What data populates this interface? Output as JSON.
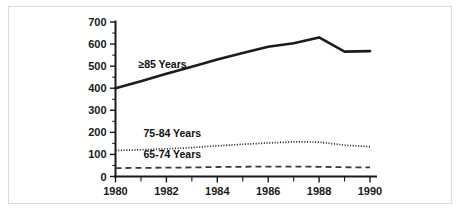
{
  "figure": {
    "background_color": "#ffffff",
    "border_color": "#dcdcdc",
    "ink_color": "#1a1a1a"
  },
  "chart_data": {
    "type": "line",
    "title": "",
    "subtitle": "",
    "xlabel": "",
    "ylabel": "",
    "xlim": [
      1980,
      1990
    ],
    "ylim": [
      0,
      700
    ],
    "grid": false,
    "legend_position": "inline-annotations",
    "x": [
      1980,
      1981,
      1982,
      1983,
      1984,
      1985,
      1986,
      1987,
      1988,
      1989,
      1990
    ],
    "x_tick_labels": [
      "1980",
      "1982",
      "1984",
      "1986",
      "1988",
      "1990"
    ],
    "x_tick_values": [
      1980,
      1982,
      1984,
      1986,
      1988,
      1990
    ],
    "x_minor_tick_values": [
      1981,
      1983,
      1985,
      1987,
      1989
    ],
    "y_tick_labels": [
      "0",
      "100",
      "200",
      "300",
      "400",
      "500",
      "600",
      "700"
    ],
    "y_tick_values": [
      0,
      100,
      200,
      300,
      400,
      500,
      600,
      700
    ],
    "y_minor_tick_values": [
      50,
      150,
      250,
      350,
      450,
      550,
      650
    ],
    "series": [
      {
        "name": "≥85 Years",
        "label": "≥85 Years",
        "style": "solid",
        "color": "#1c1c1c",
        "values": [
          400,
          432,
          465,
          497,
          530,
          560,
          588,
          604,
          630,
          566,
          568
        ],
        "label_position": {
          "x": 1980.9,
          "y": 490
        }
      },
      {
        "name": "75-84 Years",
        "label": "75-84 Years",
        "style": "dotted",
        "color": "#2b2b2b",
        "values": [
          118,
          121,
          125,
          131,
          139,
          146,
          152,
          157,
          156,
          142,
          135
        ],
        "label_position": {
          "x": 1981.1,
          "y": 178
        }
      },
      {
        "name": "65-74 Years",
        "label": "65-74 Years",
        "style": "dashed",
        "color": "#3a3a3a",
        "values": [
          38,
          39,
          40,
          41,
          43,
          44,
          45,
          45,
          44,
          42,
          41
        ],
        "label_position": {
          "x": 1981.1,
          "y": 82
        }
      }
    ]
  }
}
